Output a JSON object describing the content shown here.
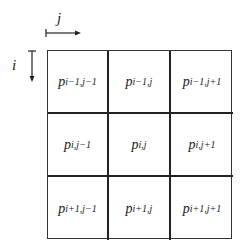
{
  "axes": {
    "j_label": "j",
    "i_label": "i"
  },
  "grid": {
    "rows": [
      [
        {
          "base": "p",
          "sub": "i−1,j−1"
        },
        {
          "base": "p",
          "sub": "i−1,j"
        },
        {
          "base": "p",
          "sub": "i−1,j+1"
        }
      ],
      [
        {
          "base": "p",
          "sub": "i,j−1"
        },
        {
          "base": "p",
          "sub": "i,j"
        },
        {
          "base": "p",
          "sub": "i,j+1"
        }
      ],
      [
        {
          "base": "p",
          "sub": "i+1,j−1"
        },
        {
          "base": "p",
          "sub": "i+1,j"
        },
        {
          "base": "p",
          "sub": "i+1,j+1"
        }
      ]
    ]
  }
}
